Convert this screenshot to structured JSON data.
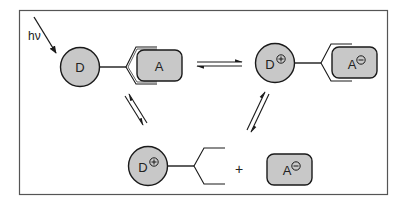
{
  "figure": {
    "light_label": "hν",
    "donor": "D",
    "acceptor": "A",
    "donor_cation": "D",
    "acceptor_anion": "A",
    "plus_charge": "+",
    "minus_charge": "−",
    "plus_sign": "+"
  },
  "colors": {
    "fill": "#c8c8c8",
    "stroke": "#1a1a1a",
    "frame": "#555555"
  }
}
